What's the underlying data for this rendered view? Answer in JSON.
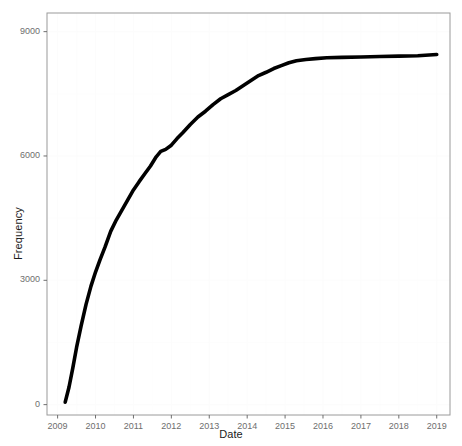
{
  "chart_data": {
    "type": "line",
    "title": "",
    "xlabel": "Date",
    "ylabel": "Frequency",
    "xlim": [
      2008.72,
      2019.35
    ],
    "ylim": [
      -250,
      9450
    ],
    "grid": true,
    "legend": null,
    "xticks": [
      "2009",
      "2010",
      "2011",
      "2012",
      "2013",
      "2014",
      "2015",
      "2016",
      "2017",
      "2018",
      "2019"
    ],
    "xtick_values": [
      2009,
      2010,
      2011,
      2012,
      2013,
      2014,
      2015,
      2016,
      2017,
      2018,
      2019
    ],
    "yticks": [
      "0",
      "3000",
      "6000",
      "9000"
    ],
    "ytick_values": [
      0,
      3000,
      6000,
      9000
    ],
    "series": [
      {
        "name": "Cumulative frequency",
        "color": "#000000",
        "line_width": 3.6,
        "x": [
          2009.2,
          2009.3,
          2009.4,
          2009.5,
          2009.62,
          2009.75,
          2009.88,
          2010.0,
          2010.12,
          2010.25,
          2010.4,
          2010.55,
          2010.7,
          2010.85,
          2011.0,
          2011.15,
          2011.3,
          2011.45,
          2011.6,
          2011.72,
          2011.85,
          2012.0,
          2012.15,
          2012.3,
          2012.5,
          2012.7,
          2012.9,
          2013.1,
          2013.3,
          2013.5,
          2013.7,
          2013.9,
          2014.1,
          2014.3,
          2014.5,
          2014.7,
          2014.9,
          2015.1,
          2015.3,
          2015.55,
          2015.8,
          2016.1,
          2016.5,
          2017.0,
          2017.5,
          2018.0,
          2018.5,
          2019.0
        ],
        "y": [
          60,
          420,
          880,
          1380,
          1900,
          2420,
          2860,
          3200,
          3500,
          3800,
          4180,
          4460,
          4700,
          4940,
          5180,
          5380,
          5570,
          5760,
          5980,
          6110,
          6160,
          6260,
          6420,
          6560,
          6760,
          6940,
          7080,
          7240,
          7380,
          7480,
          7580,
          7700,
          7820,
          7940,
          8020,
          8110,
          8180,
          8250,
          8300,
          8330,
          8350,
          8370,
          8380,
          8390,
          8400,
          8410,
          8420,
          8450
        ]
      }
    ]
  },
  "panel": {
    "background": "#ffffff",
    "border_color": "#9a9a9a",
    "grid_color": "#fcfcfc",
    "tick_color": "#6e6e6e",
    "text_color": "#1a1a1a"
  }
}
